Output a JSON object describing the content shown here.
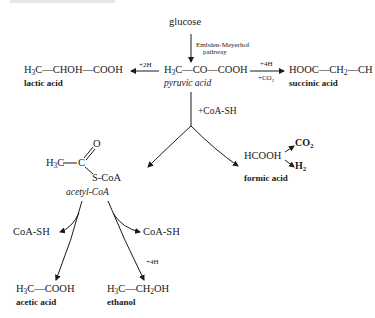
{
  "diagram": {
    "start": {
      "label": "glucose"
    },
    "pathway_label": {
      "line1": "Embden-Meyerhof",
      "line2": "pathway"
    },
    "pyruvate": {
      "formula_parts": [
        "H",
        "3",
        "C—CO—COOH"
      ],
      "name": "pyruvic acid"
    },
    "lactic": {
      "formula_parts": [
        "H",
        "3",
        "C—CHOH—COOH"
      ],
      "name": "lactic acid",
      "condition": "+2H"
    },
    "succinic": {
      "formula_parts": [
        "HOOC—CH",
        "2",
        "—CH"
      ],
      "name": "succinic acid",
      "condition_top": "+4H",
      "condition_bottom_parts": [
        "+CO",
        "2"
      ]
    },
    "coa_step": {
      "label": "+CoA-SH"
    },
    "acetyl_coa": {
      "h3c": "H",
      "h3c_sub": "3",
      "h3c_rest": "C",
      "carbonyl_c": "C",
      "oxygen": "O",
      "scoa": "S-CoA",
      "name": "acetyl-CoA"
    },
    "formic": {
      "formula": "HCOOH",
      "name": "formic acid",
      "product1": "CO",
      "product1_sub": "2",
      "product2": "H",
      "product2_sub": "2"
    },
    "acetic": {
      "formula_parts": [
        "H",
        "3",
        "C—COOH"
      ],
      "name": "acetic acid",
      "released": "CoA-SH"
    },
    "ethanol": {
      "formula_parts": [
        "H",
        "3",
        "C—CH",
        "2",
        "OH"
      ],
      "name": "ethanol",
      "released": "CoA-SH",
      "condition": "+4H"
    }
  }
}
